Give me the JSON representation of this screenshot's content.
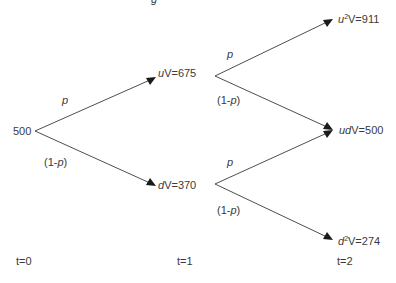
{
  "title_fragment": "g",
  "root": {
    "value": "500"
  },
  "nodes": [
    {
      "id": "u",
      "prefix": "u",
      "sup": "",
      "label": "V=675"
    },
    {
      "id": "d",
      "prefix": "d",
      "sup": "",
      "label": "V=370"
    },
    {
      "id": "uu",
      "prefix": "u",
      "sup": "2",
      "label": "V=911"
    },
    {
      "id": "ud",
      "prefix": "ud",
      "sup": "",
      "label": "V=500"
    },
    {
      "id": "dd",
      "prefix": "d",
      "sup": "2",
      "label": "V=274"
    }
  ],
  "branch_labels": {
    "up": "p",
    "down_open": "(1-",
    "down_var": "p",
    "down_close": ")"
  },
  "time_labels": [
    "t=0",
    "t=1",
    "t=2"
  ]
}
